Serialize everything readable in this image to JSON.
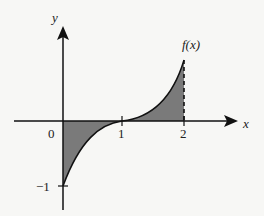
{
  "diagram": {
    "function_label": "f(x)",
    "axes": {
      "x_label": "x",
      "y_label": "y"
    },
    "ticks": {
      "x": [
        "0",
        "1",
        "2"
      ],
      "y": [
        "-1"
      ]
    },
    "x_tick_labels": {
      "zero": "0",
      "one": "1",
      "two": "2"
    },
    "y_tick_labels": {
      "minus_one": "−1"
    },
    "shaded_regions": [
      {
        "from": 0,
        "to": 1,
        "position": "below x-axis"
      },
      {
        "from": 1,
        "to": 2,
        "position": "above x-axis"
      }
    ],
    "colors": {
      "fill": "#7a7a7a",
      "stroke": "#111111",
      "background": "#f7f7f5"
    },
    "curve": "f(x) = (x-1)^3, shaded area between curve and x-axis on [0, 2]"
  }
}
